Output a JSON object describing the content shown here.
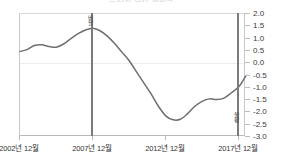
{
  "chart_data": {
    "type": "line",
    "title": "금리와 경기 사이클",
    "xlabel": "",
    "ylabel": "",
    "ylim": [
      -3.0,
      2.0
    ],
    "grid": "zero-line-only",
    "legend": "none",
    "y_ticks": [
      "2.0",
      "1.5",
      "1.0",
      "0.5",
      "0.0",
      "-0.5",
      "-1.0",
      "-1.5",
      "-2.0",
      "-2.5",
      "-3.0"
    ],
    "y_tick_values": [
      2.0,
      1.5,
      1.0,
      0.5,
      0.0,
      -0.5,
      -1.0,
      -1.5,
      -2.0,
      -2.5,
      -3.0
    ],
    "x_tick_labels": [
      "2002년 12월",
      "2007년 12월",
      "2012년 12월",
      "2017년 12월"
    ],
    "x_tick_values": [
      2002.92,
      2007.92,
      2012.92,
      2017.92
    ],
    "series": [
      {
        "name": "지표",
        "color": "#6e6e6e",
        "x": [
          2002.92,
          2003.4,
          2003.9,
          2004.4,
          2004.9,
          2005.4,
          2005.9,
          2006.4,
          2006.9,
          2007.4,
          2007.92,
          2008.4,
          2008.9,
          2009.4,
          2009.9,
          2010.4,
          2010.9,
          2011.4,
          2011.9,
          2012.4,
          2012.92,
          2013.4,
          2013.9,
          2014.4,
          2014.9,
          2015.4,
          2015.9,
          2016.4,
          2016.9,
          2017.4,
          2017.92,
          2018.4
        ],
        "values": [
          0.48,
          0.55,
          0.72,
          0.75,
          0.68,
          0.65,
          0.78,
          1.0,
          1.2,
          1.35,
          1.42,
          1.32,
          1.1,
          0.8,
          0.45,
          0.1,
          -0.35,
          -0.8,
          -1.25,
          -1.75,
          -2.15,
          -2.3,
          -2.28,
          -2.05,
          -1.75,
          -1.55,
          -1.45,
          -1.48,
          -1.42,
          -1.2,
          -0.95,
          -0.5
        ]
      }
    ],
    "annotations": [
      {
        "label": "버블",
        "x": 2007.92,
        "type": "vertical-line",
        "label_position": "top",
        "color": "#7b7b7b"
      },
      {
        "label": "불황",
        "x": 2017.92,
        "type": "vertical-line",
        "label_position": "bottom",
        "color": "#7b7b7b"
      }
    ]
  }
}
